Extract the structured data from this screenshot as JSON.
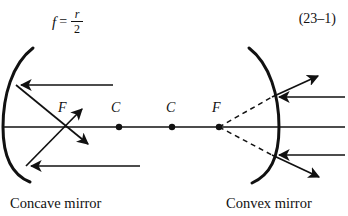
{
  "figure": {
    "background_color": "#ffffff",
    "stroke_color": "#111111",
    "formula": {
      "variable": "f",
      "equals": "=",
      "numerator": "r",
      "denominator": "2"
    },
    "equation_number": "(23–1)",
    "concave": {
      "caption": "Concave mirror",
      "focus_label": "F",
      "center_label": "C",
      "focus_point": {
        "x": 66,
        "y": 127
      },
      "center_point": {
        "x": 119,
        "y": 127
      },
      "mirror_vertex": {
        "x": 3,
        "y": 127
      },
      "axis_y": 127,
      "axis_x_start": 3,
      "axis_x_end": 160,
      "incoming_rays": [
        {
          "y": 85,
          "x_from": 113,
          "x_to": 16
        },
        {
          "y": 166,
          "x_from": 140,
          "x_to": 26
        }
      ],
      "reflected_rays": [
        {
          "x1": 16,
          "y1": 85,
          "x2": 92,
          "y2": 148
        },
        {
          "x1": 26,
          "y1": 166,
          "x2": 85,
          "y2": 105
        }
      ]
    },
    "convex": {
      "caption": "Convex mirror",
      "focus_label": "F",
      "center_label": "C",
      "focus_point": {
        "x": 219,
        "y": 127
      },
      "center_point": {
        "x": 172,
        "y": 127
      },
      "mirror_vertex": {
        "x": 279,
        "y": 127
      },
      "axis_y": 127,
      "axis_x_start": 160,
      "axis_x_end": 345,
      "incoming_rays": [
        {
          "y": 97,
          "x_from": 345,
          "x_to": 274
        },
        {
          "y": 155,
          "x_from": 345,
          "x_to": 274
        }
      ],
      "reflected_rays": [
        {
          "x1": 272,
          "y1": 97,
          "x2": 322,
          "y2": 72
        },
        {
          "x1": 272,
          "y1": 155,
          "x2": 323,
          "y2": 180
        }
      ],
      "virtual_rays_dashed": [
        {
          "x1": 219,
          "y1": 127,
          "x2": 272,
          "y2": 97
        },
        {
          "x1": 219,
          "y1": 127,
          "x2": 272,
          "y2": 155
        }
      ]
    }
  }
}
